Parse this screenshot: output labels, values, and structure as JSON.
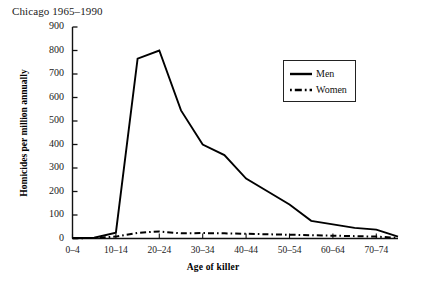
{
  "chart_data": {
    "type": "line",
    "title": "Chicago 1965–1990",
    "xlabel": "Age of killer",
    "ylabel": "Homicides per million annually",
    "categories": [
      "0–4",
      "5–9",
      "10–14",
      "15–19",
      "20–24",
      "25–29",
      "30–34",
      "35–39",
      "40–44",
      "45–49",
      "50–54",
      "55–59",
      "60–64",
      "65–69",
      "70–74",
      "75–79"
    ],
    "xtick_labels": [
      "0–4",
      "10–14",
      "20–24",
      "30–34",
      "40–44",
      "50–54",
      "60–64",
      "70–74"
    ],
    "ytick_labels": [
      "0",
      "100",
      "200",
      "300",
      "400",
      "500",
      "600",
      "700",
      "800",
      "900"
    ],
    "yticks": [
      0,
      100,
      200,
      300,
      400,
      500,
      600,
      700,
      800,
      900
    ],
    "ylim": [
      0,
      900
    ],
    "grid": false,
    "legend_position": "upper right",
    "series": [
      {
        "name": "Men",
        "style": "solid",
        "color": "#000000",
        "values": [
          2,
          3,
          25,
          765,
          800,
          545,
          400,
          355,
          255,
          200,
          145,
          75,
          60,
          45,
          38,
          8
        ]
      },
      {
        "name": "Women",
        "style": "dash-dot",
        "color": "#000000",
        "values": [
          1,
          2,
          8,
          24,
          30,
          22,
          23,
          22,
          20,
          18,
          16,
          14,
          12,
          10,
          8,
          3
        ]
      }
    ]
  },
  "legend": {
    "items": [
      {
        "label": "Men"
      },
      {
        "label": "Women"
      }
    ]
  }
}
